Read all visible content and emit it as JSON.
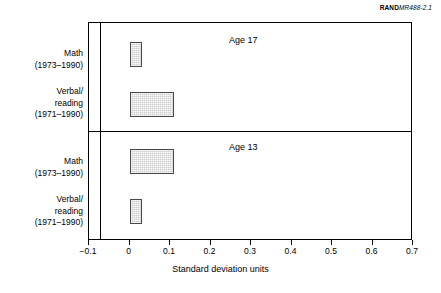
{
  "credit": {
    "rand": "RAND",
    "document_id": "MR488-2.1"
  },
  "chart_data": {
    "type": "bar",
    "orientation": "horizontal",
    "title": "",
    "xlabel": "Standard deviation units",
    "ylabel": "",
    "xlim": [
      -0.1,
      0.7
    ],
    "xticks": [
      "-0.1",
      "0",
      "0.1",
      "0.2",
      "0.3",
      "0.4",
      "0.5",
      "0.6",
      "0.7"
    ],
    "xtick_values": [
      -0.1,
      0,
      0.1,
      0.2,
      0.3,
      0.4,
      0.5,
      0.6,
      0.7
    ],
    "grid": false,
    "legend": "none",
    "panels": [
      {
        "title": "Age 17",
        "categories": [
          {
            "name": "Math",
            "years": "(1973–1990)"
          },
          {
            "name": "Verbal/",
            "name2": "reading",
            "years": "(1971–1990)"
          }
        ],
        "values": [
          0.03,
          0.11
        ]
      },
      {
        "title": "Age 13",
        "categories": [
          {
            "name": "Math",
            "years": "(1973–1990)"
          },
          {
            "name": "Verbal/",
            "name2": "reading",
            "years": "(1971–1990)"
          }
        ],
        "values": [
          0.11,
          0.03
        ]
      }
    ]
  },
  "colors": {
    "bar_fill": "#cfcfcf",
    "bar_border": "#4a4a4a",
    "axis": "#000000",
    "background": "#ffffff"
  }
}
